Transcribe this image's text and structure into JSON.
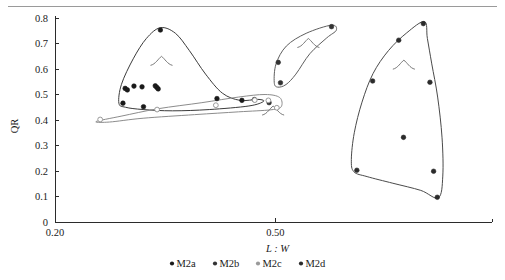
{
  "figure": {
    "background_color": "#ffffff",
    "has_top_rule": true
  },
  "axes": {
    "y": {
      "label": "QR",
      "ticks": [
        "0.8",
        "0.7",
        "0.6",
        "0.5",
        "0.4",
        "0.3",
        "0.2",
        "0.1",
        "0"
      ],
      "min": 0,
      "max": 0.8
    },
    "x": {
      "label": "L : W",
      "ticks": [
        "0.20",
        "0.50"
      ],
      "tick_values": [
        0.2,
        0.5
      ],
      "min": 0.2,
      "max": 0.795
    }
  },
  "legend": {
    "position": "bottom-center",
    "entries": [
      {
        "label": "M2a",
        "color": "#1a1a1a"
      },
      {
        "label": "M2b",
        "color": "#333333"
      },
      {
        "label": "M2c",
        "color": "#9a9a9a"
      },
      {
        "label": "M2d",
        "color": "#2b2b2b"
      }
    ]
  },
  "chart_data": {
    "type": "scatter",
    "title": "",
    "xlabel": "L : W",
    "ylabel": "QR",
    "xlim": [
      0.2,
      0.795
    ],
    "ylim": [
      0,
      0.8
    ],
    "grid": false,
    "legend_position": "bottom-center",
    "annotations": [
      {
        "text": "molar-glyph",
        "x": 0.345,
        "y": 0.63
      },
      {
        "text": "molar-glyph",
        "x": 0.545,
        "y": 0.7
      },
      {
        "text": "molar-glyph",
        "x": 0.497,
        "y": 0.435
      },
      {
        "text": "molar-glyph",
        "x": 0.675,
        "y": 0.615
      }
    ],
    "series": [
      {
        "name": "M2a",
        "color": "#1a1a1a",
        "marker": "circle",
        "points": [
          {
            "x": 0.3435,
            "y": 0.753
          },
          {
            "x": 0.2955,
            "y": 0.524
          },
          {
            "x": 0.2985,
            "y": 0.518
          },
          {
            "x": 0.3075,
            "y": 0.533
          },
          {
            "x": 0.3185,
            "y": 0.53
          },
          {
            "x": 0.3385,
            "y": 0.528
          },
          {
            "x": 0.3365,
            "y": 0.534
          },
          {
            "x": 0.3405,
            "y": 0.522
          },
          {
            "x": 0.2925,
            "y": 0.466
          },
          {
            "x": 0.3205,
            "y": 0.452
          },
          {
            "x": 0.4205,
            "y": 0.484
          },
          {
            "x": 0.4545,
            "y": 0.477
          },
          {
            "x": 0.4715,
            "y": 0.48
          }
        ],
        "hull": [
          [
            0.287,
            0.466
          ],
          [
            0.2905,
            0.54
          ],
          [
            0.3065,
            0.64
          ],
          [
            0.3245,
            0.72
          ],
          [
            0.3435,
            0.762
          ],
          [
            0.364,
            0.74
          ],
          [
            0.383,
            0.672
          ],
          [
            0.405,
            0.58
          ],
          [
            0.428,
            0.505
          ],
          [
            0.452,
            0.477
          ],
          [
            0.476,
            0.481
          ],
          [
            0.484,
            0.473
          ],
          [
            0.464,
            0.455
          ],
          [
            0.41,
            0.441
          ],
          [
            0.36,
            0.436
          ],
          [
            0.32,
            0.441
          ],
          [
            0.296,
            0.45
          ]
        ]
      },
      {
        "name": "M2b",
        "color": "#333333",
        "marker": "circle",
        "points": [
          {
            "x": 0.504,
            "y": 0.626
          },
          {
            "x": 0.507,
            "y": 0.546
          },
          {
            "x": 0.5765,
            "y": 0.766
          },
          {
            "x": 0.4915,
            "y": 0.468
          }
        ],
        "hull": [
          [
            0.5765,
            0.772
          ],
          [
            0.542,
            0.74
          ],
          [
            0.515,
            0.69
          ],
          [
            0.501,
            0.62
          ],
          [
            0.4985,
            0.548
          ],
          [
            0.503,
            0.529
          ],
          [
            0.5145,
            0.539
          ],
          [
            0.528,
            0.58
          ],
          [
            0.547,
            0.66
          ],
          [
            0.57,
            0.722
          ],
          [
            0.583,
            0.752
          ]
        ]
      },
      {
        "name": "M2c",
        "color": "#9a9a9a",
        "marker": "circle-open",
        "points": [
          {
            "x": 0.2615,
            "y": 0.402
          },
          {
            "x": 0.339,
            "y": 0.441
          },
          {
            "x": 0.419,
            "y": 0.458
          },
          {
            "x": 0.472,
            "y": 0.478
          },
          {
            "x": 0.4905,
            "y": 0.477
          },
          {
            "x": 0.502,
            "y": 0.448
          }
        ],
        "hull": [
          [
            0.256,
            0.394
          ],
          [
            0.29,
            0.415
          ],
          [
            0.34,
            0.444
          ],
          [
            0.4,
            0.468
          ],
          [
            0.45,
            0.49
          ],
          [
            0.486,
            0.5
          ],
          [
            0.506,
            0.488
          ],
          [
            0.508,
            0.452
          ],
          [
            0.494,
            0.44
          ],
          [
            0.45,
            0.432
          ],
          [
            0.39,
            0.421
          ],
          [
            0.32,
            0.407
          ],
          [
            0.274,
            0.392
          ]
        ]
      },
      {
        "name": "M2d",
        "color": "#2b2b2b",
        "marker": "circle",
        "points": [
          {
            "x": 0.7015,
            "y": 0.778
          },
          {
            "x": 0.668,
            "y": 0.713
          },
          {
            "x": 0.6325,
            "y": 0.553
          },
          {
            "x": 0.7105,
            "y": 0.548
          },
          {
            "x": 0.6745,
            "y": 0.332
          },
          {
            "x": 0.611,
            "y": 0.203
          },
          {
            "x": 0.7155,
            "y": 0.199
          },
          {
            "x": 0.7205,
            "y": 0.097
          }
        ],
        "hull": [
          [
            0.703,
            0.786
          ],
          [
            0.679,
            0.742
          ],
          [
            0.654,
            0.672
          ],
          [
            0.633,
            0.582
          ],
          [
            0.618,
            0.47
          ],
          [
            0.6075,
            0.35
          ],
          [
            0.6035,
            0.245
          ],
          [
            0.607,
            0.197
          ],
          [
            0.625,
            0.178
          ],
          [
            0.66,
            0.152
          ],
          [
            0.698,
            0.124
          ],
          [
            0.722,
            0.095
          ],
          [
            0.728,
            0.18
          ],
          [
            0.727,
            0.33
          ],
          [
            0.721,
            0.49
          ],
          [
            0.713,
            0.62
          ],
          [
            0.707,
            0.72
          ]
        ]
      }
    ]
  }
}
